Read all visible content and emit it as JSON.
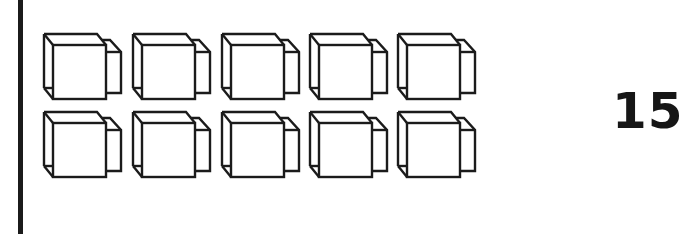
{
  "figure": {
    "rows": 2,
    "columns": 5,
    "block_count": 10,
    "block_label": "cube-with-small-cube",
    "count_label": "15",
    "stroke_color": "#1b1b1b",
    "fill_color": "#ffffff"
  },
  "layout": {
    "column_x": [
      43,
      132,
      221,
      309,
      397
    ],
    "row_y": [
      33,
      111
    ]
  }
}
